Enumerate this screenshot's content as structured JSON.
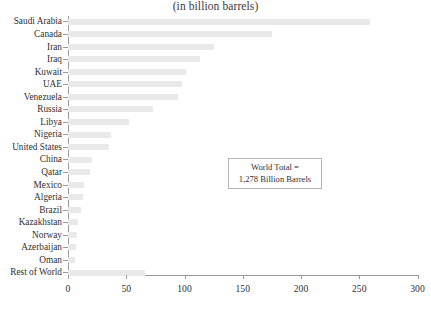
{
  "chart_data": {
    "type": "bar",
    "orientation": "horizontal",
    "title": "(in billion barrels)",
    "xlabel": "",
    "ylabel": "",
    "xlim": [
      0,
      300
    ],
    "xticks": [
      0,
      50,
      100,
      150,
      200,
      250,
      300
    ],
    "xtick_labels": [
      "0",
      "50",
      "100",
      "150",
      "200",
      "250",
      "300"
    ],
    "grid": false,
    "legend": null,
    "bar_color": "#e9e9e9",
    "axis_color": "#9a9a9a",
    "categories": [
      "Saudi Arabia",
      "Canada",
      "Iran",
      "Iraq",
      "Kuwait",
      "UAE",
      "Venezuela",
      "Russia",
      "Libya",
      "Nigeria",
      "United States",
      "China",
      "Qatar",
      "Mexico",
      "Algeria",
      "Brazil",
      "Kazakhstan",
      "Norway",
      "Azerbaijan",
      "Oman",
      "Rest of World"
    ],
    "values": [
      259,
      175,
      125,
      113,
      101,
      98,
      94,
      73,
      52,
      37,
      35,
      21,
      19,
      14,
      13,
      11,
      9,
      8,
      7,
      6,
      66
    ],
    "annotations": [
      {
        "name": "world-total",
        "line1": "World Total =",
        "line2": "1,278 Billion Barrels"
      }
    ]
  }
}
